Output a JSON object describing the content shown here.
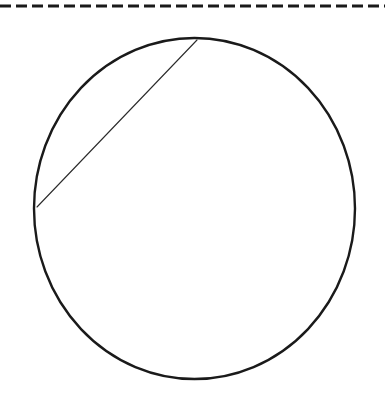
{
  "page": {
    "width": 385,
    "height": 398,
    "background_color": "#ffffff"
  },
  "figure": {
    "caption": "",
    "ink_color": "#1a1a1a"
  },
  "elements": {
    "divider": {
      "name": "dashed-divider",
      "style": "dashed",
      "color": "#1a1a1a",
      "thickness": 3,
      "dash_length": 11,
      "gap_length": 5,
      "y": 6,
      "x_start": 0,
      "x_end": 385
    },
    "circle": {
      "name": "circle-outline",
      "center_x": 194.5,
      "center_y": 208.5,
      "radius_x": 160.5,
      "radius_y": 170.5,
      "stroke_color": "#1a1a1a",
      "stroke_width": 2.4,
      "fill": "none"
    },
    "chord": {
      "name": "chord-line",
      "x1": 197,
      "y1": 40,
      "x2": 37,
      "y2": 207,
      "stroke_color": "#2b2b2b",
      "stroke_width": 1.1
    }
  }
}
